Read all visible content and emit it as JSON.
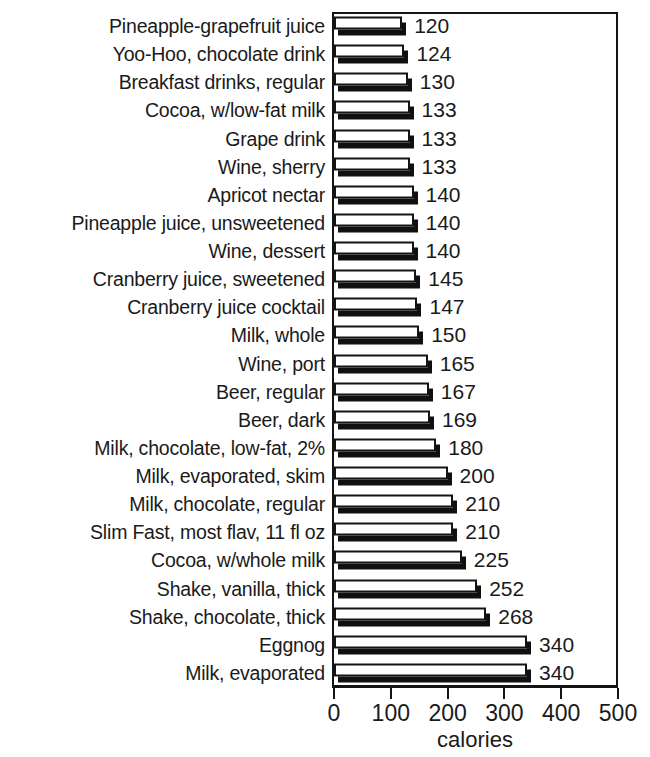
{
  "chart_data": {
    "type": "bar",
    "orientation": "horizontal",
    "title": "",
    "xlabel": "calories",
    "ylabel": "",
    "xlim": [
      0,
      500
    ],
    "xticks": [
      0,
      100,
      200,
      300,
      400,
      500
    ],
    "xtick_labels": [
      "0",
      "100",
      "200",
      "300",
      "400",
      "500"
    ],
    "grid": false,
    "legend": false,
    "value_labels": true,
    "categories": [
      "Pineapple-grapefruit juice",
      "Yoo-Hoo, chocolate drink",
      "Breakfast drinks, regular",
      "Cocoa, w/low-fat milk",
      "Grape drink",
      "Wine, sherry",
      "Apricot nectar",
      "Pineapple juice, unsweetened",
      "Wine, dessert",
      "Cranberry juice, sweetened",
      "Cranberry juice cocktail",
      "Milk, whole",
      "Wine, port",
      "Beer, regular",
      "Beer, dark",
      "Milk, chocolate, low-fat, 2%",
      "Milk, evaporated, skim",
      "Milk, chocolate, regular",
      "Slim Fast, most flav, 11 fl oz",
      "Cocoa, w/whole milk",
      "Shake, vanilla, thick",
      "Shake, chocolate, thick",
      "Eggnog",
      "Milk, evaporated"
    ],
    "values": [
      120,
      124,
      130,
      133,
      133,
      133,
      140,
      140,
      140,
      145,
      147,
      150,
      165,
      167,
      169,
      180,
      200,
      210,
      210,
      225,
      252,
      268,
      340,
      340
    ],
    "value_label_text": [
      "120",
      "124",
      "130",
      "133",
      "133",
      "133",
      "140",
      "140",
      "140",
      "145",
      "147",
      "150",
      "165",
      "167",
      "169",
      "180",
      "200",
      "210",
      "210",
      "225",
      "252",
      "268",
      "340",
      "340"
    ],
    "colors": {
      "bar_face": "#ffffff",
      "bar_outline": "#141414",
      "bar_shadow": "#101010",
      "axis": "#141414",
      "text": "#1a1a1a",
      "background": "#ffffff"
    }
  }
}
